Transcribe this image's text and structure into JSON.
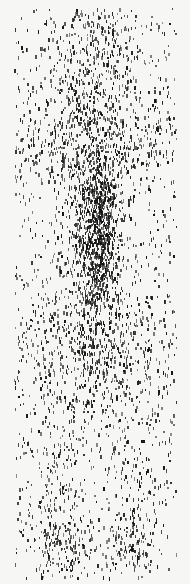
{
  "image": {
    "width": 190,
    "height": 584,
    "background": "#f6f6f4",
    "ink": "#141414",
    "pattern": "speckle-streak-field",
    "field": {
      "x0": 14,
      "x1": 176,
      "y0": 8,
      "y1": 578
    },
    "seed": 7,
    "background_dots": 900,
    "clusters": [
      {
        "name": "top-band",
        "cx": 95,
        "cy": 60,
        "sx": 30,
        "sy": 50,
        "count": 520
      },
      {
        "name": "upper-wide-band",
        "cx": 95,
        "cy": 140,
        "sx": 70,
        "sy": 22,
        "count": 520
      },
      {
        "name": "central-column-upper",
        "cx": 96,
        "cy": 200,
        "sx": 12,
        "sy": 25,
        "count": 420
      },
      {
        "name": "central-column-lower",
        "cx": 96,
        "cy": 255,
        "sx": 12,
        "sy": 25,
        "count": 380
      },
      {
        "name": "central-column-spine",
        "cx": 96,
        "cy": 240,
        "sx": 18,
        "sy": 90,
        "count": 500
      },
      {
        "name": "mid-wide-band",
        "cx": 95,
        "cy": 350,
        "sx": 45,
        "sy": 40,
        "count": 650
      },
      {
        "name": "lower-left-lobe",
        "cx": 63,
        "cy": 548,
        "sx": 14,
        "sy": 22,
        "count": 160
      },
      {
        "name": "lower-right-lobe",
        "cx": 130,
        "cy": 545,
        "sx": 12,
        "sy": 20,
        "count": 140
      },
      {
        "name": "lower-left-streak",
        "cx": 60,
        "cy": 480,
        "sx": 14,
        "sy": 40,
        "count": 110
      },
      {
        "name": "lower-right-streak",
        "cx": 135,
        "cy": 470,
        "sx": 14,
        "sy": 40,
        "count": 90
      }
    ]
  }
}
